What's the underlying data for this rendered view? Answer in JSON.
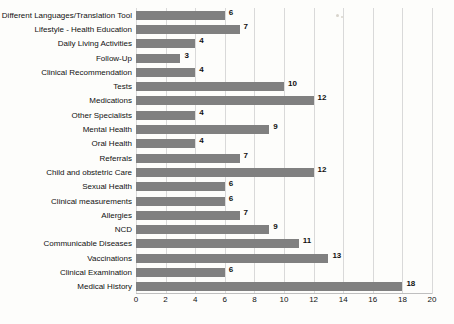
{
  "chart_data": {
    "type": "bar",
    "orientation": "horizontal",
    "title": "",
    "xlabel": "",
    "ylabel": "",
    "xlim": [
      0,
      20
    ],
    "xticks": [
      0,
      2,
      4,
      6,
      8,
      10,
      12,
      14,
      16,
      18,
      20
    ],
    "grid": true,
    "legend": false,
    "bar_color": "#808080",
    "categories": [
      "Different Languages/Translation Tool",
      "Lifestyle - Health Education",
      "Daily Living Activities",
      "Follow-Up",
      "Clinical Recommendation",
      "Tests",
      "Medications",
      "Other Specialists",
      "Mental Health",
      "Oral Health",
      "Referrals",
      "Child and obstetric Care",
      "Sexual Health",
      "Clinical measurements",
      "Allergies",
      "NCD",
      "Communicable Diseases",
      "Vaccinations",
      "Clinical Examination",
      "Medical History"
    ],
    "values": [
      6,
      7,
      4,
      3,
      4,
      10,
      12,
      4,
      9,
      4,
      7,
      12,
      6,
      6,
      7,
      9,
      11,
      13,
      6,
      18
    ]
  }
}
